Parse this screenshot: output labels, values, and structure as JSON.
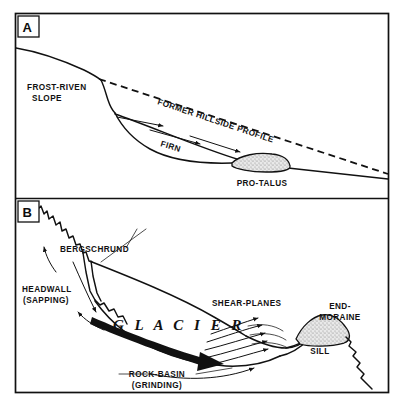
{
  "figure": {
    "background_color": "#ffffff",
    "ink_color": "#111111",
    "stipple_color": "#cfcfcf"
  },
  "panels": [
    {
      "id": "A",
      "letter": "A",
      "name": "pro-talus / firn stage",
      "labels": [
        {
          "key": "frost_riven",
          "line1": "FROST-RIVEN",
          "line2": "SLOPE"
        },
        {
          "key": "former_profile",
          "text": "FORMER HILLSIDE PROFILE"
        },
        {
          "key": "firn",
          "text": "FIRN"
        },
        {
          "key": "pro_talus",
          "text": "PRO-TALUS"
        }
      ]
    },
    {
      "id": "B",
      "letter": "B",
      "name": "glacier / cirque stage",
      "labels": [
        {
          "key": "bergschrund",
          "text": "BERGSCHRUND"
        },
        {
          "key": "headwall",
          "line1": "HEADWALL",
          "line2": "(SAPPING)"
        },
        {
          "key": "glacier",
          "text": "GLACIER"
        },
        {
          "key": "shear_planes",
          "text": "SHEAR-PLANES"
        },
        {
          "key": "end_moraine",
          "line1": "END-",
          "line2": "MORAINE"
        },
        {
          "key": "sill",
          "text": "SILL"
        },
        {
          "key": "rock_basin",
          "line1": "ROCK-BASIN",
          "line2": "(GRINDING)"
        }
      ]
    }
  ],
  "textA": {
    "frost_riven_1": "FROST-RIVEN",
    "frost_riven_2": "SLOPE",
    "former_profile": "FORMER HILLSIDE PROFILE",
    "firn": "FIRN",
    "pro_talus": "PRO-TALUS",
    "letter": "A"
  },
  "textB": {
    "bergschrund": "BERGSCHRUND",
    "headwall_1": "HEADWALL",
    "headwall_2": "(SAPPING)",
    "glacier": "G L A C I E R",
    "shear_planes": "SHEAR-PLANES",
    "end_moraine_1": "END-",
    "end_moraine_2": "MORAINE",
    "sill": "SILL",
    "rock_basin_1": "ROCK-BASIN",
    "rock_basin_2": "(GRINDING)",
    "letter": "B"
  }
}
